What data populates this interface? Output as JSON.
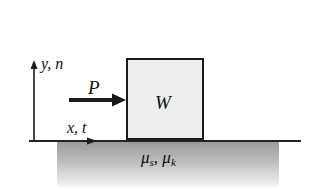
{
  "diagram": {
    "title": "",
    "axes": {
      "vertical_label": "y, n",
      "horizontal_label": "x, t"
    },
    "force": {
      "label": "P",
      "direction": "right"
    },
    "block": {
      "label": "W"
    },
    "surface": {
      "label_mu": "μ",
      "sub_static": "s",
      "separator": ", ",
      "sub_kinetic": "k"
    },
    "colors": {
      "lines": "#1a1a1a",
      "block_fill": "#eeeeee",
      "ground_top": "#9a9a9a",
      "ground_bottom": "#f6f6f6"
    }
  }
}
